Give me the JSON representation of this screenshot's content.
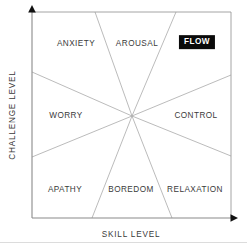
{
  "diagram": {
    "axes": {
      "x_label": "SKILL LEVEL",
      "y_label": "CHALLENGE LEVEL",
      "x_arrow_icon": "arrow-right-icon",
      "y_arrow_icon": "arrow-up-icon"
    },
    "zones": [
      {
        "id": "anxiety",
        "label": "ANXIETY",
        "x": 76,
        "y": 44,
        "highlight": false
      },
      {
        "id": "arousal",
        "label": "AROUSAL",
        "x": 137,
        "y": 44,
        "highlight": false
      },
      {
        "id": "flow",
        "label": "FLOW",
        "x": 197,
        "y": 42,
        "highlight": true
      },
      {
        "id": "worry",
        "label": "WORRY",
        "x": 66,
        "y": 116,
        "highlight": false
      },
      {
        "id": "control",
        "label": "CONTROL",
        "x": 196,
        "y": 116,
        "highlight": false
      },
      {
        "id": "apathy",
        "label": "APATHY",
        "x": 65,
        "y": 190,
        "highlight": false
      },
      {
        "id": "boredom",
        "label": "BOREDOM",
        "x": 131,
        "y": 190,
        "highlight": false
      },
      {
        "id": "relaxation",
        "label": "RELAXATION",
        "x": 195,
        "y": 190,
        "highlight": false
      }
    ],
    "colors": {
      "border": "#8a8a8a",
      "divider": "#a9a9a9",
      "axis": "#8a8a8a",
      "arrow": "#111111",
      "text": "#3a3a3a",
      "highlight_bg": "#0a0a0a",
      "highlight_text": "#ffffff",
      "footer_rule": "#dcdcdc",
      "background": "#ffffff"
    },
    "geometry": {
      "center_x": 132,
      "center_y": 116,
      "plot_left": 32,
      "plot_right": 231,
      "plot_top": 12,
      "plot_bottom": 218
    }
  }
}
